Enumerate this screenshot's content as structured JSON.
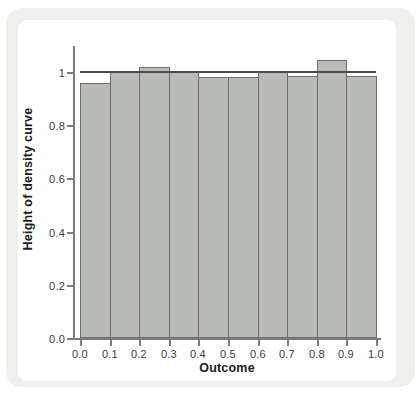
{
  "figure": {
    "page_background": "#ffffff",
    "panel_color": "#efefec",
    "plot_background": "#ffffff"
  },
  "chart_data": {
    "type": "bar",
    "subtype": "histogram",
    "title": "",
    "xlabel": "Outcome",
    "ylabel": "Height of density curve",
    "bin_edges": [
      0.0,
      0.1,
      0.2,
      0.3,
      0.4,
      0.5,
      0.6,
      0.7,
      0.8,
      0.9,
      1.0
    ],
    "values": [
      0.96,
      1.005,
      1.02,
      1.0,
      0.98,
      0.98,
      1.0,
      0.985,
      1.045,
      0.985
    ],
    "density_line": {
      "y": 1.0
    },
    "xticks": [
      "0.0",
      "0.1",
      "0.2",
      "0.3",
      "0.4",
      "0.5",
      "0.6",
      "0.7",
      "0.8",
      "0.9",
      "1.0"
    ],
    "yticks": [
      {
        "value": 0.0,
        "label": "0.0"
      },
      {
        "value": 0.2,
        "label": "0.2"
      },
      {
        "value": 0.4,
        "label": "0.4"
      },
      {
        "value": 0.6,
        "label": "0.6"
      },
      {
        "value": 0.8,
        "label": "0.8"
      },
      {
        "value": 1.0,
        "label": "1"
      }
    ],
    "xlim": [
      0.0,
      1.0
    ],
    "ylim": [
      0.0,
      1.1
    ],
    "grid": false,
    "legend": false,
    "bar_fill": "#b9bcb6",
    "bar_edge": "#6e6f6c",
    "axis_color": "#7c7c78",
    "density_line_color": "#4c4c49"
  }
}
